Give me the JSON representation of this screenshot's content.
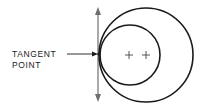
{
  "diagram": {
    "label_line1": "TANGENT",
    "label_line2": "POINT",
    "colors": {
      "stroke": "#1a1a1a",
      "axis": "#6e6e6e",
      "center_mark": "#555555",
      "background": "#ffffff"
    },
    "elements": {
      "large_circle": {
        "cx": 146,
        "cy": 55,
        "r": 47
      },
      "small_circle": {
        "cx": 130,
        "cy": 55,
        "r": 30
      },
      "center_marks": [
        {
          "x": 129,
          "y": 55
        },
        {
          "x": 146,
          "y": 55
        }
      ],
      "tangent_line": {
        "x": 98,
        "y1": 8,
        "y2": 101
      },
      "tangent_point": {
        "x": 99,
        "y": 54
      }
    }
  }
}
